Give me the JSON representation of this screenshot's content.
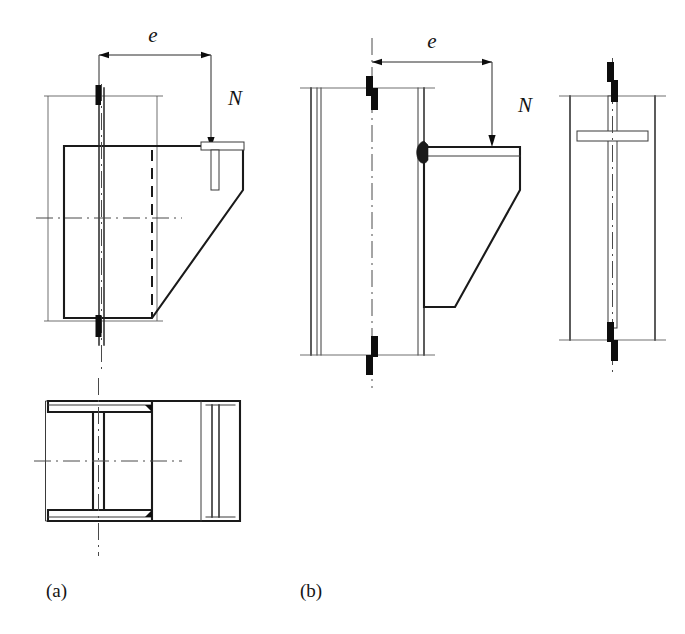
{
  "figure": {
    "domain_note": "structural steel bracket-to-column connection details",
    "background_color": "#ffffff",
    "line_color": "#1a1a1a",
    "weld_color": "#0d0d0d",
    "panels": [
      {
        "key": "a",
        "caption": "(a)",
        "caption_x": 46,
        "caption_y": 597,
        "description": "Bracket welded to I-section column - elevation and plan view",
        "dimension_label": "e",
        "dimension_label_x": 153,
        "dimension_label_y": 42,
        "force_label": "N",
        "force_label_x": 228,
        "force_label_y": 105
      },
      {
        "key": "b",
        "caption": "(b)",
        "caption_x": 300,
        "caption_y": 597,
        "description": "Bracket welded to column flange - elevation and side view",
        "dimension_label": "e",
        "dimension_label_x": 432,
        "dimension_label_y": 48,
        "force_label": "N",
        "force_label_x": 518,
        "force_label_y": 112
      }
    ],
    "symbols": {
      "eccentricity": "e",
      "axial_force": "N"
    }
  }
}
